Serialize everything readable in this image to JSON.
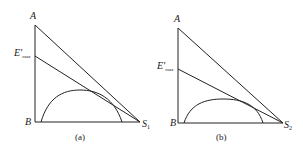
{
  "panels": [
    {
      "id": "a",
      "caption": "(a)",
      "labels": {
        "top": "A",
        "mid": "E'",
        "mid_sub": "max",
        "origin": "B",
        "right": "S",
        "right_sub": "1"
      },
      "geometry": {
        "axis_x": 35,
        "A_y": 25,
        "E_y": 56,
        "base_y": 122,
        "S_x": 140,
        "arc_x0": 41,
        "arc_x1": 122,
        "arc_peak_y": 91
      }
    },
    {
      "id": "b",
      "caption": "(b)",
      "labels": {
        "top": "A",
        "mid": "E'",
        "mid_sub": "max",
        "origin": "B",
        "right": "S",
        "right_sub": "2"
      },
      "geometry": {
        "axis_x": 178,
        "A_y": 28,
        "E_y": 69,
        "base_y": 123,
        "S_x": 283,
        "arc_x0": 184,
        "arc_x1": 263,
        "arc_peak_y": 99
      }
    }
  ]
}
